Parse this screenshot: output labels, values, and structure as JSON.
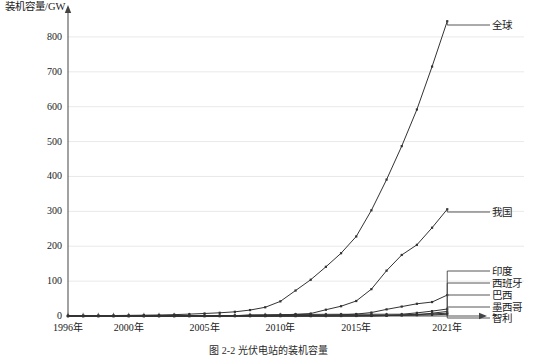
{
  "figure": {
    "caption": "图 2-2   光伏电站的装机容量",
    "y_axis_title": "装机容量/GW"
  },
  "chart_data": {
    "type": "line",
    "title": "",
    "xlabel": "",
    "ylabel": "装机容量/GW",
    "ylim": [
      0,
      860
    ],
    "xlim": [
      1996,
      2022.5
    ],
    "grid": true,
    "legend_position": "right-of-line-ends",
    "markers": true,
    "yticks": [
      0,
      100,
      200,
      300,
      400,
      500,
      600,
      700,
      800
    ],
    "ytick_labels": [
      "0",
      "100",
      "200",
      "300",
      "400",
      "500",
      "600",
      "700",
      "800"
    ],
    "xticks": [
      1996,
      2000,
      2005,
      2010,
      2015,
      2021
    ],
    "xtick_labels": [
      "1996年",
      "2000年",
      "2005年",
      "2010年",
      "2015年",
      "2021年"
    ],
    "x": [
      1996,
      1997,
      1998,
      1999,
      2000,
      2001,
      2002,
      2003,
      2004,
      2005,
      2006,
      2007,
      2008,
      2009,
      2010,
      2011,
      2012,
      2013,
      2014,
      2015,
      2016,
      2017,
      2018,
      2019,
      2020,
      2021
    ],
    "series": [
      {
        "name": "全球",
        "label": "全球",
        "color": "#333333",
        "values": [
          0.6,
          0.8,
          1.0,
          1.3,
          1.8,
          2.3,
          2.9,
          3.9,
          5.4,
          7.2,
          9.2,
          12.0,
          17.0,
          25.0,
          42.0,
          73.0,
          104.0,
          141.0,
          180.0,
          228.0,
          303.0,
          391.0,
          487.0,
          592.0,
          715.0,
          845.0
        ]
      },
      {
        "name": "我国",
        "label": "我国",
        "color": "#333333",
        "values": [
          0.02,
          0.03,
          0.04,
          0.05,
          0.07,
          0.1,
          0.15,
          0.2,
          0.3,
          0.5,
          0.8,
          1.0,
          1.4,
          2.0,
          3.0,
          5.0,
          7.0,
          18.0,
          28.0,
          43.0,
          77.0,
          130.0,
          175.0,
          204.0,
          253.0,
          306.0
        ]
      },
      {
        "name": "印度",
        "label": "印度",
        "color": "#333333",
        "values": [
          0.0,
          0.0,
          0.0,
          0.0,
          0.0,
          0.0,
          0.0,
          0.0,
          0.0,
          0.0,
          0.1,
          0.1,
          0.2,
          0.3,
          0.5,
          1.0,
          1.5,
          2.3,
          3.3,
          5.5,
          9.9,
          19.0,
          27.0,
          35.0,
          40.0,
          60.0
        ]
      },
      {
        "name": "西班牙",
        "label": "西班牙",
        "color": "#333333",
        "values": [
          0.0,
          0.0,
          0.0,
          0.0,
          0.0,
          0.0,
          0.0,
          0.0,
          0.1,
          0.1,
          0.2,
          0.7,
          3.4,
          3.5,
          3.9,
          4.3,
          4.6,
          4.8,
          4.9,
          5.0,
          5.0,
          5.0,
          5.1,
          9.0,
          14.0,
          20.0
        ]
      },
      {
        "name": "巴西",
        "label": "巴西",
        "color": "#333333",
        "values": [
          0.0,
          0.0,
          0.0,
          0.0,
          0.0,
          0.0,
          0.0,
          0.0,
          0.0,
          0.0,
          0.0,
          0.0,
          0.0,
          0.0,
          0.0,
          0.0,
          0.0,
          0.0,
          0.0,
          0.0,
          0.1,
          1.1,
          2.0,
          3.0,
          8.0,
          13.0
        ]
      },
      {
        "name": "墨西哥",
        "label": "墨西哥",
        "color": "#333333",
        "values": [
          0.0,
          0.0,
          0.0,
          0.0,
          0.0,
          0.0,
          0.0,
          0.0,
          0.0,
          0.0,
          0.0,
          0.0,
          0.0,
          0.0,
          0.0,
          0.0,
          0.1,
          0.1,
          0.2,
          0.3,
          0.4,
          1.0,
          3.0,
          5.0,
          6.0,
          8.0
        ]
      },
      {
        "name": "智利",
        "label": "智利",
        "color": "#333333",
        "values": [
          0.0,
          0.0,
          0.0,
          0.0,
          0.0,
          0.0,
          0.0,
          0.0,
          0.0,
          0.0,
          0.0,
          0.0,
          0.0,
          0.0,
          0.0,
          0.0,
          0.0,
          0.1,
          0.4,
          0.8,
          1.6,
          2.1,
          2.3,
          2.6,
          3.2,
          5.0
        ]
      }
    ],
    "annotations": [
      {
        "text": "全球",
        "series": "全球",
        "label_x": 492,
        "label_y": 20
      },
      {
        "text": "我国",
        "series": "我国",
        "label_x": 492,
        "label_y": 207
      },
      {
        "text": "印度",
        "series": "印度",
        "label_x": 492,
        "label_y": 266
      },
      {
        "text": "西班牙",
        "series": "西班牙",
        "label_x": 492,
        "label_y": 278
      },
      {
        "text": "巴西",
        "series": "巴西",
        "label_x": 492,
        "label_y": 290
      },
      {
        "text": "墨西哥",
        "series": "墨西哥",
        "label_x": 492,
        "label_y": 302
      },
      {
        "text": "智利",
        "series": "智利",
        "label_x": 492,
        "label_y": 313
      }
    ]
  }
}
